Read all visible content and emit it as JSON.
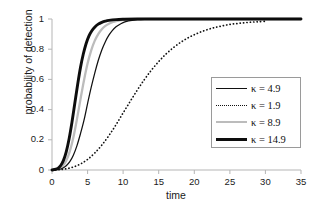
{
  "chart_data": {
    "type": "line",
    "title": "",
    "xlabel": "time",
    "ylabel": "probability of detection",
    "xlim": [
      0,
      35
    ],
    "ylim": [
      0,
      1
    ],
    "xticks": [
      "0",
      "5",
      "10",
      "15",
      "20",
      "25",
      "30",
      "35"
    ],
    "yticks": [
      "0",
      "0.2",
      "0.4",
      "0.6",
      "0.8",
      "1"
    ],
    "grid": false,
    "legend_position": "center-right",
    "series": [
      {
        "name": "κ = 4.9",
        "style": "solid-thin",
        "color": "#111111",
        "x": [
          0,
          1,
          1.5,
          2,
          2.5,
          3,
          3.5,
          4,
          4.5,
          5,
          5.5,
          6,
          6.5,
          7,
          7.5,
          8,
          8.5,
          9,
          9.5,
          10,
          10.5,
          11,
          12,
          13,
          14,
          16,
          18,
          20,
          24,
          28,
          30,
          35
        ],
        "values": [
          0,
          0.004,
          0.012,
          0.028,
          0.055,
          0.098,
          0.16,
          0.24,
          0.33,
          0.44,
          0.545,
          0.64,
          0.725,
          0.795,
          0.85,
          0.893,
          0.925,
          0.948,
          0.964,
          0.976,
          0.984,
          0.989,
          0.995,
          0.998,
          0.999,
          1,
          1,
          1,
          1,
          1,
          1,
          1
        ]
      },
      {
        "name": "κ = 1.9",
        "style": "dotted",
        "color": "#111111",
        "x": [
          0,
          1,
          2,
          3,
          4,
          5,
          6,
          7,
          8,
          9,
          10,
          11,
          12,
          13,
          14,
          15,
          16,
          17,
          18,
          19,
          20,
          21,
          22,
          23,
          24,
          25,
          26,
          27,
          28,
          29,
          30
        ],
        "values": [
          0,
          0.002,
          0.008,
          0.02,
          0.04,
          0.07,
          0.112,
          0.165,
          0.228,
          0.3,
          0.378,
          0.455,
          0.53,
          0.6,
          0.663,
          0.718,
          0.767,
          0.808,
          0.843,
          0.872,
          0.896,
          0.916,
          0.932,
          0.945,
          0.955,
          0.964,
          0.97,
          0.975,
          0.979,
          0.982,
          0.985
        ]
      },
      {
        "name": "κ = 8.9",
        "style": "solid-gray",
        "color": "#bcbcbc",
        "x": [
          0,
          1,
          1.5,
          2,
          2.5,
          3,
          3.5,
          4,
          4.5,
          5,
          5.5,
          6,
          6.5,
          7,
          7.5,
          8,
          8.5,
          9,
          10,
          11,
          12,
          14,
          17,
          20,
          25,
          30,
          35
        ],
        "values": [
          0,
          0.008,
          0.026,
          0.062,
          0.123,
          0.215,
          0.335,
          0.468,
          0.595,
          0.705,
          0.79,
          0.855,
          0.9,
          0.932,
          0.954,
          0.969,
          0.979,
          0.986,
          0.994,
          0.997,
          0.999,
          1,
          1,
          1,
          1,
          1,
          1
        ]
      },
      {
        "name": "κ = 14.9",
        "style": "solid-thick",
        "color": "#0d0d0d",
        "x": [
          0,
          0.8,
          1.2,
          1.6,
          2,
          2.4,
          2.8,
          3.2,
          3.6,
          4,
          4.4,
          4.8,
          5.2,
          5.6,
          6,
          6.5,
          7,
          7.5,
          8,
          9,
          10,
          12,
          15,
          20,
          25,
          30,
          35
        ],
        "values": [
          0,
          0.01,
          0.028,
          0.062,
          0.12,
          0.205,
          0.315,
          0.44,
          0.565,
          0.678,
          0.768,
          0.838,
          0.888,
          0.922,
          0.946,
          0.966,
          0.978,
          0.986,
          0.991,
          0.996,
          0.998,
          1,
          1,
          1,
          1,
          1,
          1
        ]
      }
    ]
  },
  "axes": {
    "x_title": "time",
    "y_title": "probability of detection"
  }
}
